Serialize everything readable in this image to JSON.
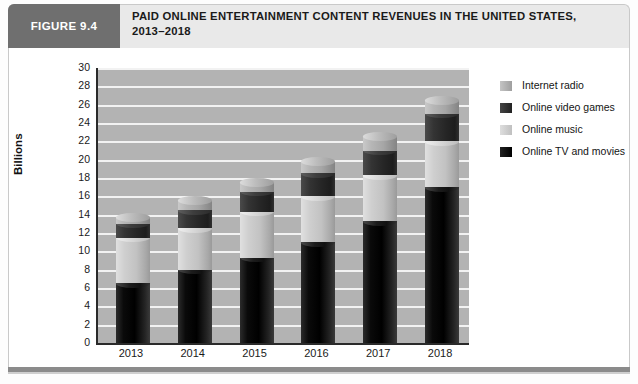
{
  "figure": {
    "tab_label": "FIGURE 9.4",
    "title": "PAID ONLINE ENTERTAINMENT CONTENT REVENUES IN THE UNITED STATES, 2013–2018"
  },
  "legend": {
    "items": [
      {
        "label": "Internet radio",
        "key": "radio",
        "color": "#b0b0b0"
      },
      {
        "label": "Online video games",
        "key": "games",
        "color": "#2b2b2b"
      },
      {
        "label": "Online music",
        "key": "music",
        "color": "#cccccc"
      },
      {
        "label": "Online TV and movies",
        "key": "tv",
        "color": "#000000"
      }
    ]
  },
  "axes": {
    "ylabel": "Billions",
    "ytick_labels": [
      "30",
      "28",
      "26",
      "24",
      "22",
      "20",
      "18",
      "16",
      "14",
      "12",
      "10",
      "8",
      "6",
      "4",
      "2",
      "0"
    ],
    "xtick_labels": [
      "2013",
      "2014",
      "2015",
      "2016",
      "2017",
      "2018"
    ]
  },
  "chart_data": {
    "type": "bar",
    "title": "PAID ONLINE ENTERTAINMENT CONTENT REVENUES IN THE UNITED STATES, 2013–2018",
    "xlabel": "",
    "ylabel": "Billions",
    "ylim": [
      0,
      30
    ],
    "ytick_step": 2,
    "grid": true,
    "stacked": true,
    "legend_position": "right",
    "categories": [
      "2013",
      "2014",
      "2015",
      "2016",
      "2017",
      "2018"
    ],
    "series": [
      {
        "name": "Online TV and movies",
        "color": "#000000",
        "values": [
          6.5,
          8.0,
          9.3,
          11.0,
          13.3,
          17.0
        ]
      },
      {
        "name": "Online music",
        "color": "#cccccc",
        "values": [
          5.0,
          4.5,
          5.0,
          5.0,
          5.0,
          5.0
        ]
      },
      {
        "name": "Online video games",
        "color": "#2b2b2b",
        "values": [
          1.5,
          2.0,
          2.2,
          2.5,
          2.7,
          3.0
        ]
      },
      {
        "name": "Internet radio",
        "color": "#b0b0b0",
        "values": [
          0.7,
          1.0,
          1.0,
          1.3,
          1.5,
          1.5
        ]
      }
    ],
    "totals": [
      13.7,
      15.5,
      17.5,
      19.8,
      22.5,
      26.5
    ]
  }
}
